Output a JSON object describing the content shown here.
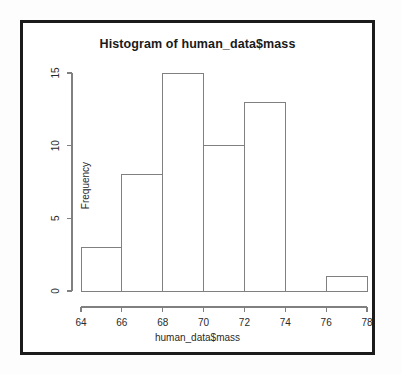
{
  "chart_data": {
    "type": "bar",
    "title": "Histogram of human_data$mass",
    "xlabel": "human_data$mass",
    "ylabel": "Frequency",
    "categories": [
      "64-66",
      "66-68",
      "68-70",
      "70-72",
      "72-74",
      "74-76",
      "76-78"
    ],
    "bin_edges": [
      64,
      66,
      68,
      70,
      72,
      74,
      76,
      78
    ],
    "values": [
      3,
      8,
      15,
      10,
      13,
      0,
      1
    ],
    "xlim": [
      64,
      78
    ],
    "ylim": [
      0,
      15
    ],
    "xticks": [
      64,
      66,
      68,
      70,
      72,
      74,
      76,
      78
    ],
    "xtick_labels": [
      "64",
      "66",
      "68",
      "70",
      "72",
      "74",
      "76",
      "78"
    ],
    "yticks": [
      0,
      5,
      10,
      15
    ],
    "ytick_labels": [
      "0",
      "5",
      "10",
      "15"
    ],
    "grid": false,
    "legend": false,
    "bar_fill": "#ffffff",
    "bar_stroke": "#808080",
    "axis_color": "#808080",
    "text_color": "#2a2a2a",
    "frame_color": "#1b1b1b",
    "background": "#ffffff"
  },
  "plot": {
    "title": "Histogram of human_data$mass",
    "xlabel": "human_data$mass",
    "ylabel": "Frequency"
  }
}
